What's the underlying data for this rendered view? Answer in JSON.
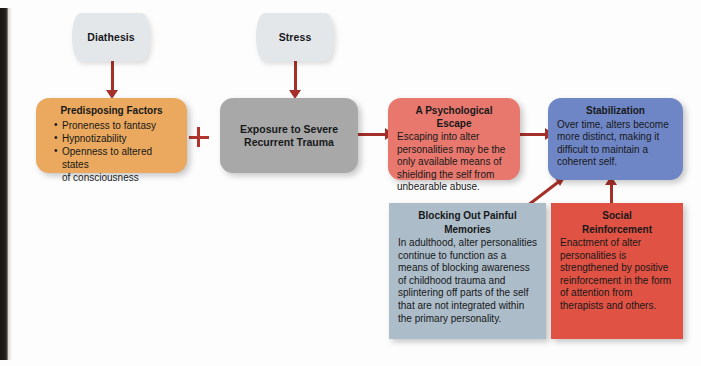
{
  "diagram": {
    "colors": {
      "orange": "#eaa95e",
      "gray": "#a8a8a8",
      "salmon": "#e8786e",
      "blue": "#6f86c6",
      "bluegray": "#acbcc8",
      "red": "#e05243",
      "connector": "#a5302a",
      "diamond": "#e4e7ea",
      "background": "#fdfdfd"
    },
    "nodes": {
      "diathesis": {
        "label": "Diathesis"
      },
      "stress": {
        "label": "Stress"
      },
      "predisposing_factors": {
        "title": "Predisposing Factors",
        "bullets": [
          "Proneness to fantasy",
          "Hypnotizability",
          "Openness to altered states"
        ],
        "bullet_continuation": "of consciousness"
      },
      "exposure": {
        "title_line1": "Exposure to Severe",
        "title_line2": "Recurrent Trauma"
      },
      "psychological_escape": {
        "title": "A Psychological Escape",
        "body": "Escaping into alter personalities may be the only available means of shielding the self from unbearable abuse."
      },
      "stabilization": {
        "title": "Stabilization",
        "body": "Over time, alters become more distinct, making it difficult to maintain a coherent self."
      },
      "blocking_memories": {
        "title_line1": "Blocking Out Painful",
        "title_line2": "Memories",
        "body": "In adulthood, alter personalities continue to function as a means of blocking awareness of childhood trauma and splintering off parts of the self that are not integrated within the primary personality."
      },
      "social_reinforcement": {
        "title_line1": "Social",
        "title_line2": "Reinforcement",
        "body": "Enactment of alter personalities is strengthened by positive reinforcement in the form of attention from therapists and others."
      }
    },
    "operators": {
      "plus": "+"
    }
  }
}
